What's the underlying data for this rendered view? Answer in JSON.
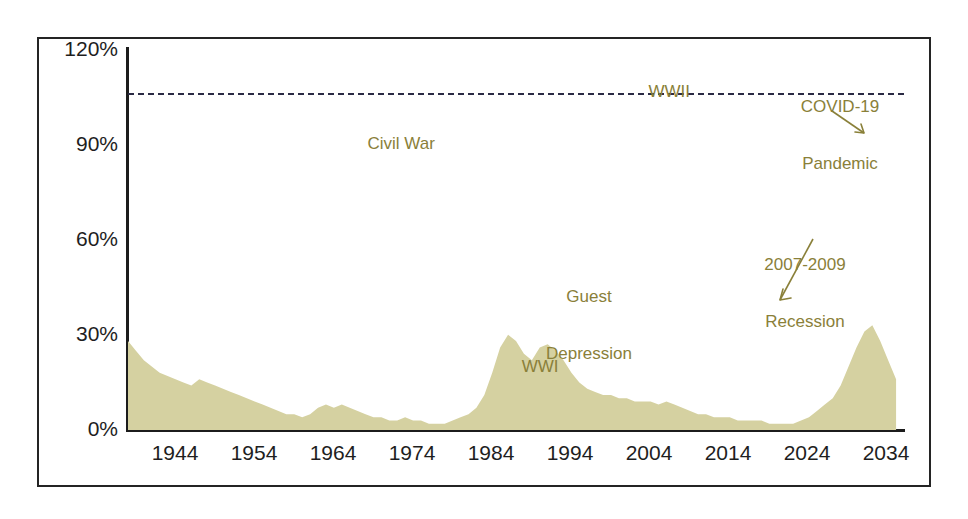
{
  "chart_data": {
    "type": "area",
    "title": "",
    "xlabel": "",
    "ylabel": "",
    "xlim": [
      1940,
      2038
    ],
    "ylim": [
      0,
      120
    ],
    "grid": false,
    "legend": null,
    "fill_color": "#d5d1a1",
    "annotation_color": "#8a8039",
    "axis_color": "#1e1e1e",
    "reference_line": {
      "value": 106,
      "style": "dashed",
      "color": "#2a2a44"
    },
    "y_ticks": [
      "0%",
      "30%",
      "60%",
      "90%",
      "120%"
    ],
    "y_tick_values": [
      0,
      30,
      60,
      90,
      120
    ],
    "x_ticks": [
      "1944",
      "1954",
      "1964",
      "1974",
      "1984",
      "1994",
      "2004",
      "2014",
      "2024",
      "2034"
    ],
    "x_tick_values": [
      1944,
      1954,
      1964,
      1974,
      1984,
      1994,
      2004,
      2014,
      2024,
      2034
    ],
    "x": [
      1940,
      1941,
      1942,
      1943,
      1944,
      1945,
      1946,
      1947,
      1948,
      1949,
      1950,
      1951,
      1952,
      1953,
      1954,
      1955,
      1956,
      1957,
      1958,
      1959,
      1960,
      1961,
      1962,
      1963,
      1964,
      1965,
      1966,
      1967,
      1968,
      1969,
      1970,
      1971,
      1972,
      1973,
      1974,
      1975,
      1976,
      1977,
      1978,
      1979,
      1980,
      1981,
      1982,
      1983,
      1984,
      1985,
      1986,
      1987,
      1988,
      1989,
      1990,
      1991,
      1992,
      1993,
      1994,
      1995,
      1996,
      1997,
      1998,
      1999,
      2000,
      2001,
      2002,
      2003,
      2004,
      2005,
      2006,
      2007,
      2008,
      2009,
      2010,
      2011,
      2012,
      2013,
      2014,
      2015,
      2016,
      2017,
      2018,
      2019,
      2020,
      2021,
      2022,
      2023,
      2024,
      2025,
      2026,
      2027,
      2028,
      2029,
      2030,
      2031,
      2032,
      2033,
      2034,
      2035,
      2036,
      2037
    ],
    "values": [
      28,
      25,
      22,
      20,
      18,
      17,
      16,
      15,
      14,
      16,
      15,
      14,
      13,
      12,
      11,
      10,
      9,
      8,
      7,
      6,
      5,
      5,
      4,
      5,
      7,
      8,
      7,
      8,
      7,
      6,
      5,
      4,
      4,
      3,
      3,
      4,
      3,
      3,
      2,
      2,
      2,
      3,
      4,
      5,
      7,
      11,
      18,
      26,
      30,
      28,
      24,
      22,
      26,
      27,
      25,
      22,
      18,
      15,
      13,
      12,
      11,
      11,
      10,
      10,
      9,
      9,
      9,
      8,
      9,
      8,
      7,
      6,
      5,
      5,
      4,
      4,
      4,
      3,
      3,
      3,
      3,
      2,
      2,
      2,
      2,
      3,
      4,
      6,
      8,
      10,
      14,
      20,
      26,
      31,
      33,
      28,
      22,
      16
    ],
    "annotations": [
      {
        "id": "civil-war",
        "text": "Civil War",
        "x_pixel_pct": 0.334,
        "y_pixel_pct": 0.215,
        "lines": [
          "Civil War"
        ]
      },
      {
        "id": "wwi",
        "text": "WWI",
        "x_pixel_pct": 0.487,
        "y_pixel_pct": 0.273,
        "lines": [
          "WWI"
        ]
      },
      {
        "id": "great-depression",
        "text": "Guest Depression",
        "x_pixel_pct": 0.575,
        "y_pixel_pct": 0.158,
        "lines": [
          "Guest",
          "Depression"
        ]
      },
      {
        "id": "wwii",
        "text": "WWII",
        "x_pixel_pct": 0.682,
        "y_pixel_pct": 0.025,
        "lines": [
          "WWII"
        ]
      },
      {
        "id": "recession",
        "text": "2007-2009 Recession",
        "x_pixel_pct": 0.823,
        "y_pixel_pct": 0.125,
        "lines": [
          "2007-2009",
          "Recession"
        ]
      },
      {
        "id": "covid",
        "text": "COVID-19 Pandemic",
        "x_pixel_pct": 0.917,
        "y_pixel_pct": 0.015,
        "lines": [
          "COVID-19",
          "Pandemic"
        ]
      }
    ]
  },
  "labels": {
    "y_0": "0%",
    "y_30": "30%",
    "y_60": "60%",
    "y_90": "90%",
    "y_120": "120%",
    "x_1944": "1944",
    "x_1954": "1954",
    "x_1964": "1964",
    "x_1974": "1974",
    "x_1984": "1984",
    "x_1994": "1994",
    "x_2004": "2004",
    "x_2014": "2014",
    "x_2024": "2024",
    "x_2034": "2034"
  },
  "annotation_text": {
    "civil_war": "Civil War",
    "wwi": "WWI",
    "great_depression_l1": "Guest",
    "great_depression_l2": "Depression",
    "wwii": "WWII",
    "recession_l1": "2007-2009",
    "recession_l2": "Recession",
    "covid_l1": "COVID-19",
    "covid_l2": "Pandemic"
  }
}
